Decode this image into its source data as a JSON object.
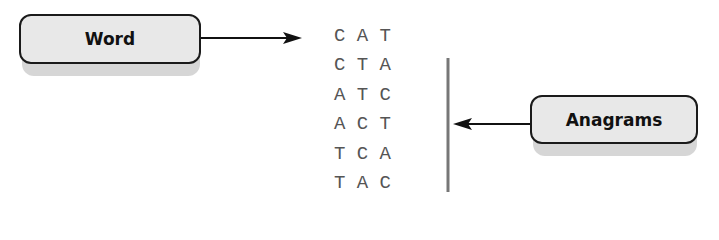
{
  "word_label": "Word",
  "anagrams_label": "Anagrams",
  "rows": [
    {
      "text": "C A T"
    },
    {
      "text": "C T A"
    },
    {
      "text": "A T C"
    },
    {
      "text": "A C T"
    },
    {
      "text": "T C A"
    },
    {
      "text": "T A C"
    }
  ],
  "colors": {
    "box_fill": "#e8e8e8",
    "box_border": "#1a1a1a",
    "shadow": "#d6d6d6",
    "letters": "#555555",
    "bracket": "#777777"
  }
}
